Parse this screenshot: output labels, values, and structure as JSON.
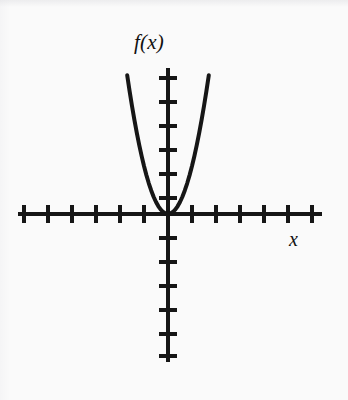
{
  "figure": {
    "background_color": "#fafafa",
    "ink_color": "#161616",
    "width": 348,
    "height": 400
  },
  "labels": {
    "y_axis": "f(x)",
    "x_axis": "x"
  },
  "chart_data": {
    "type": "line",
    "title": "",
    "subtitle": "",
    "xlabel": "x",
    "ylabel": "f(x)",
    "function": "f(x) = 2x^2",
    "curve_color": "#161616",
    "curve_width_px": 4,
    "grid": false,
    "legend": null,
    "axis_ticks_labeled": false,
    "tick_spacing_units": 1,
    "tick_spacing_px": 24,
    "origin_px": [
      168,
      214
    ],
    "xlim": [
      -6.25,
      6.4
    ],
    "ylim": [
      -6.2,
      6.1
    ],
    "x_ticks": [
      -6,
      -5,
      -4,
      -3,
      -2,
      -1,
      1,
      2,
      3,
      4,
      5,
      6
    ],
    "y_ticks": [
      -6,
      -5,
      -4,
      -3,
      -2,
      -1,
      1,
      2,
      3,
      4,
      5,
      6
    ],
    "x": [
      -1.7,
      -1.6,
      -1.5,
      -1.4,
      -1.3,
      -1.2,
      -1.1,
      -1.0,
      -0.9,
      -0.8,
      -0.7,
      -0.6,
      -0.5,
      -0.4,
      -0.3,
      -0.2,
      -0.1,
      0.0,
      0.1,
      0.2,
      0.3,
      0.4,
      0.5,
      0.6,
      0.7,
      0.8,
      0.9,
      1.0,
      1.1,
      1.2,
      1.3,
      1.4,
      1.5,
      1.6,
      1.7
    ],
    "y": [
      5.78,
      5.12,
      4.5,
      3.92,
      3.38,
      2.88,
      2.42,
      2.0,
      1.62,
      1.28,
      0.98,
      0.72,
      0.5,
      0.32,
      0.18,
      0.08,
      0.02,
      0.0,
      0.02,
      0.08,
      0.18,
      0.32,
      0.5,
      0.72,
      0.98,
      1.28,
      1.62,
      2.0,
      2.42,
      2.88,
      3.38,
      3.92,
      4.5,
      5.12,
      5.78
    ],
    "vertex": [
      0,
      0
    ],
    "annotations": []
  }
}
